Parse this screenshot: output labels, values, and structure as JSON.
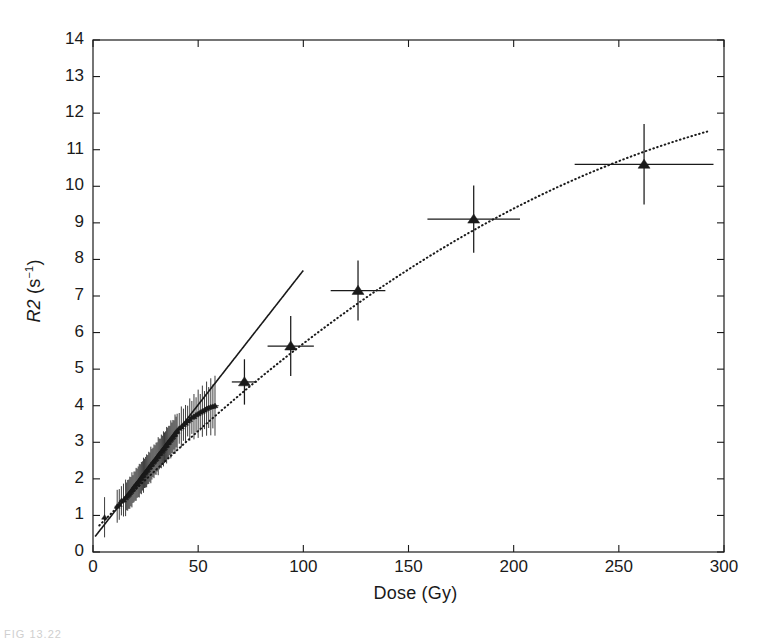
{
  "figure": {
    "caption_fragment": "FIG 13.22"
  },
  "chart_data": {
    "type": "scatter",
    "title": "",
    "xlabel": "Dose (Gy)",
    "ylabel_prefix": "R2",
    "ylabel_units": "(s",
    "ylabel_exponent": "−1",
    "ylabel_units_close": ")",
    "ylabel_full": "R2 (s−1)",
    "xlim": [
      0,
      300
    ],
    "ylim": [
      0,
      14
    ],
    "xticks": [
      0,
      50,
      100,
      150,
      200,
      250,
      300
    ],
    "yticks": [
      0,
      1,
      2,
      3,
      4,
      5,
      6,
      7,
      8,
      9,
      10,
      11,
      12,
      13,
      14
    ],
    "xtick_labels": [
      "0",
      "50",
      "100",
      "150",
      "200",
      "250",
      "300"
    ],
    "ytick_labels": [
      "0",
      "1",
      "2",
      "3",
      "4",
      "5",
      "6",
      "7",
      "8",
      "9",
      "10",
      "11",
      "12",
      "13",
      "14"
    ],
    "grid": false,
    "legend": null,
    "axis_box": true,
    "tick_direction": "in",
    "marker_color": "#1a1a1a",
    "line_color": "#1a1a1a",
    "series": [
      {
        "name": "Low-dose samples",
        "marker": "small-triangle",
        "style": "points-with-errorbars",
        "points": [
          {
            "x": 5.5,
            "y": 0.95,
            "xerr": 0.0,
            "yerr": 0.55
          },
          {
            "x": 11.5,
            "y": 1.25,
            "xerr": 1.2,
            "yerr": 0.45
          },
          {
            "x": 12.5,
            "y": 1.3,
            "xerr": 1.2,
            "yerr": 0.42
          },
          {
            "x": 13.5,
            "y": 1.4,
            "xerr": 1.0,
            "yerr": 0.4
          },
          {
            "x": 14.5,
            "y": 1.42,
            "xerr": 1.0,
            "yerr": 0.45
          },
          {
            "x": 15.5,
            "y": 1.48,
            "xerr": 1.0,
            "yerr": 0.5
          },
          {
            "x": 16.0,
            "y": 1.52,
            "xerr": 1.0,
            "yerr": 0.38
          },
          {
            "x": 16.5,
            "y": 1.55,
            "xerr": 1.0,
            "yerr": 0.42
          },
          {
            "x": 17.0,
            "y": 1.58,
            "xerr": 1.0,
            "yerr": 0.4
          },
          {
            "x": 17.5,
            "y": 1.62,
            "xerr": 1.0,
            "yerr": 0.44
          },
          {
            "x": 18.0,
            "y": 1.65,
            "xerr": 1.0,
            "yerr": 0.4
          },
          {
            "x": 18.5,
            "y": 1.7,
            "xerr": 1.0,
            "yerr": 0.48
          },
          {
            "x": 19.0,
            "y": 1.72,
            "xerr": 1.0,
            "yerr": 0.38
          },
          {
            "x": 19.5,
            "y": 1.78,
            "xerr": 1.0,
            "yerr": 0.42
          },
          {
            "x": 20.0,
            "y": 1.8,
            "xerr": 1.0,
            "yerr": 0.4
          },
          {
            "x": 20.5,
            "y": 1.85,
            "xerr": 1.0,
            "yerr": 0.45
          },
          {
            "x": 21.0,
            "y": 1.88,
            "xerr": 1.0,
            "yerr": 0.4
          },
          {
            "x": 21.5,
            "y": 1.92,
            "xerr": 1.0,
            "yerr": 0.42
          },
          {
            "x": 22.0,
            "y": 1.95,
            "xerr": 1.0,
            "yerr": 0.46
          },
          {
            "x": 22.5,
            "y": 2.0,
            "xerr": 1.0,
            "yerr": 0.4
          },
          {
            "x": 23.0,
            "y": 2.02,
            "xerr": 1.0,
            "yerr": 0.44
          },
          {
            "x": 23.5,
            "y": 2.08,
            "xerr": 1.0,
            "yerr": 0.4
          },
          {
            "x": 24.0,
            "y": 2.1,
            "xerr": 1.0,
            "yerr": 0.48
          },
          {
            "x": 24.5,
            "y": 2.15,
            "xerr": 1.0,
            "yerr": 0.4
          },
          {
            "x": 25.0,
            "y": 2.18,
            "xerr": 1.0,
            "yerr": 0.42
          },
          {
            "x": 25.5,
            "y": 2.22,
            "xerr": 1.0,
            "yerr": 0.45
          },
          {
            "x": 26.0,
            "y": 2.25,
            "xerr": 1.0,
            "yerr": 0.4
          },
          {
            "x": 26.5,
            "y": 2.3,
            "xerr": 1.0,
            "yerr": 0.44
          },
          {
            "x": 27.0,
            "y": 2.32,
            "xerr": 1.0,
            "yerr": 0.4
          },
          {
            "x": 27.5,
            "y": 2.38,
            "xerr": 1.0,
            "yerr": 0.5
          },
          {
            "x": 28.0,
            "y": 2.4,
            "xerr": 1.0,
            "yerr": 0.42
          },
          {
            "x": 28.5,
            "y": 2.45,
            "xerr": 1.0,
            "yerr": 0.4
          },
          {
            "x": 29.0,
            "y": 2.48,
            "xerr": 1.0,
            "yerr": 0.46
          },
          {
            "x": 29.5,
            "y": 2.52,
            "xerr": 1.0,
            "yerr": 0.4
          },
          {
            "x": 30.0,
            "y": 2.55,
            "xerr": 1.0,
            "yerr": 0.44
          },
          {
            "x": 30.5,
            "y": 2.6,
            "xerr": 1.0,
            "yerr": 0.4
          },
          {
            "x": 31.0,
            "y": 2.62,
            "xerr": 1.0,
            "yerr": 0.52
          },
          {
            "x": 31.5,
            "y": 2.68,
            "xerr": 1.0,
            "yerr": 0.42
          },
          {
            "x": 32.0,
            "y": 2.7,
            "xerr": 1.0,
            "yerr": 0.4
          },
          {
            "x": 32.5,
            "y": 2.75,
            "xerr": 1.0,
            "yerr": 0.46
          },
          {
            "x": 33.0,
            "y": 2.78,
            "xerr": 1.0,
            "yerr": 0.4
          },
          {
            "x": 33.5,
            "y": 2.82,
            "xerr": 1.0,
            "yerr": 0.48
          },
          {
            "x": 34.0,
            "y": 2.85,
            "xerr": 1.0,
            "yerr": 0.42
          },
          {
            "x": 34.5,
            "y": 2.9,
            "xerr": 1.0,
            "yerr": 0.4
          },
          {
            "x": 35.0,
            "y": 2.92,
            "xerr": 1.0,
            "yerr": 0.5
          },
          {
            "x": 35.5,
            "y": 2.98,
            "xerr": 1.0,
            "yerr": 0.42
          },
          {
            "x": 36.0,
            "y": 3.0,
            "xerr": 1.0,
            "yerr": 0.45
          },
          {
            "x": 36.5,
            "y": 3.05,
            "xerr": 1.0,
            "yerr": 0.4
          },
          {
            "x": 37.0,
            "y": 3.08,
            "xerr": 1.0,
            "yerr": 0.52
          },
          {
            "x": 37.5,
            "y": 3.12,
            "xerr": 1.0,
            "yerr": 0.42
          },
          {
            "x": 38.0,
            "y": 3.15,
            "xerr": 1.0,
            "yerr": 0.46
          },
          {
            "x": 38.5,
            "y": 3.2,
            "xerr": 1.0,
            "yerr": 0.4
          },
          {
            "x": 39.0,
            "y": 3.22,
            "xerr": 1.0,
            "yerr": 0.54
          },
          {
            "x": 39.5,
            "y": 3.28,
            "xerr": 1.0,
            "yerr": 0.42
          },
          {
            "x": 40.0,
            "y": 3.3,
            "xerr": 1.2,
            "yerr": 0.48
          },
          {
            "x": 41.0,
            "y": 3.38,
            "xerr": 1.2,
            "yerr": 0.42
          },
          {
            "x": 42.0,
            "y": 3.42,
            "xerr": 1.2,
            "yerr": 0.56
          },
          {
            "x": 43.0,
            "y": 3.48,
            "xerr": 1.2,
            "yerr": 0.44
          },
          {
            "x": 44.0,
            "y": 3.52,
            "xerr": 1.2,
            "yerr": 0.5
          },
          {
            "x": 45.0,
            "y": 3.58,
            "xerr": 1.2,
            "yerr": 0.42
          },
          {
            "x": 46.0,
            "y": 3.62,
            "xerr": 1.2,
            "yerr": 0.58
          },
          {
            "x": 47.0,
            "y": 3.68,
            "xerr": 1.2,
            "yerr": 0.45
          },
          {
            "x": 48.0,
            "y": 3.7,
            "xerr": 1.5,
            "yerr": 0.62
          },
          {
            "x": 49.0,
            "y": 3.75,
            "xerr": 1.5,
            "yerr": 0.48
          },
          {
            "x": 50.0,
            "y": 3.78,
            "xerr": 1.5,
            "yerr": 0.66
          },
          {
            "x": 51.0,
            "y": 3.82,
            "xerr": 1.5,
            "yerr": 0.5
          },
          {
            "x": 52.0,
            "y": 3.85,
            "xerr": 1.5,
            "yerr": 0.7
          },
          {
            "x": 53.0,
            "y": 3.88,
            "xerr": 1.5,
            "yerr": 0.52
          },
          {
            "x": 54.0,
            "y": 3.92,
            "xerr": 1.5,
            "yerr": 0.74
          },
          {
            "x": 55.0,
            "y": 3.95,
            "xerr": 1.8,
            "yerr": 0.56
          },
          {
            "x": 56.0,
            "y": 3.97,
            "xerr": 1.8,
            "yerr": 0.78
          },
          {
            "x": 57.0,
            "y": 3.98,
            "xerr": 1.8,
            "yerr": 0.6
          },
          {
            "x": 58.0,
            "y": 4.0,
            "xerr": 1.8,
            "yerr": 0.82
          }
        ]
      },
      {
        "name": "High-dose samples",
        "marker": "triangle",
        "style": "points-with-errorbars",
        "points": [
          {
            "x": 72,
            "y": 4.65,
            "xerr": 6,
            "yerr": 0.62
          },
          {
            "x": 94,
            "y": 5.63,
            "xerr": 11,
            "yerr": 0.82
          },
          {
            "x": 126,
            "y": 7.15,
            "xerr": 13,
            "yerr": 0.82
          },
          {
            "x": 181,
            "y": 9.1,
            "xerr": 22,
            "yerr": 0.92
          },
          {
            "x": 262,
            "y": 10.6,
            "xerr": 33,
            "yerr": 1.1
          }
        ]
      }
    ],
    "fits": [
      {
        "name": "Linear fit (low dose)",
        "style": "solid",
        "x_range": [
          1,
          100
        ],
        "intercept": 0.35,
        "slope": 0.0735
      },
      {
        "name": "Polynomial fit (full range)",
        "style": "dotted",
        "x_range": [
          3,
          292
        ],
        "coefficients": {
          "c0": 0.55,
          "c1": 0.0588,
          "c2": -7.3e-05
        }
      }
    ]
  }
}
